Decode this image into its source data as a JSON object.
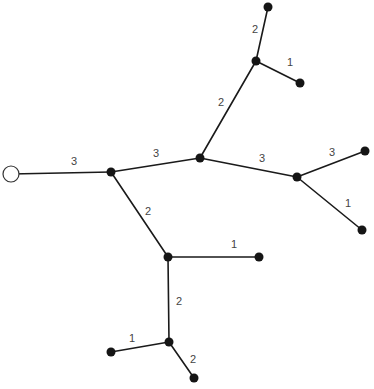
{
  "diagram": {
    "type": "weighted-tree",
    "root": "n0",
    "nodes": [
      {
        "id": "n0",
        "x": 11,
        "y": 174,
        "r": 8,
        "style": "open"
      },
      {
        "id": "n1",
        "x": 111,
        "y": 172,
        "r": 4.5,
        "style": "filled"
      },
      {
        "id": "n2",
        "x": 200,
        "y": 158,
        "r": 4.5,
        "style": "filled"
      },
      {
        "id": "n3",
        "x": 256,
        "y": 61,
        "r": 4.5,
        "style": "filled"
      },
      {
        "id": "n4",
        "x": 268,
        "y": 7,
        "r": 4.5,
        "style": "filled"
      },
      {
        "id": "n5",
        "x": 300,
        "y": 83,
        "r": 4.5,
        "style": "filled"
      },
      {
        "id": "n6",
        "x": 297,
        "y": 177,
        "r": 4.5,
        "style": "filled"
      },
      {
        "id": "n7",
        "x": 365,
        "y": 151,
        "r": 4.5,
        "style": "filled"
      },
      {
        "id": "n8",
        "x": 362,
        "y": 230,
        "r": 4.5,
        "style": "filled"
      },
      {
        "id": "n9",
        "x": 168,
        "y": 257,
        "r": 4.5,
        "style": "filled"
      },
      {
        "id": "n10",
        "x": 259,
        "y": 257,
        "r": 4.5,
        "style": "filled"
      },
      {
        "id": "n11",
        "x": 169,
        "y": 342,
        "r": 4.5,
        "style": "filled"
      },
      {
        "id": "n12",
        "x": 111,
        "y": 352,
        "r": 4.5,
        "style": "filled"
      },
      {
        "id": "n13",
        "x": 194,
        "y": 378,
        "r": 4.5,
        "style": "filled"
      }
    ],
    "edges": [
      {
        "from": "n0",
        "to": "n1",
        "label": "3",
        "lx": 74,
        "ly": 162
      },
      {
        "from": "n1",
        "to": "n2",
        "label": "3",
        "lx": 156,
        "ly": 154
      },
      {
        "from": "n2",
        "to": "n3",
        "label": "2",
        "lx": 221,
        "ly": 103
      },
      {
        "from": "n3",
        "to": "n4",
        "label": "2",
        "lx": 255,
        "ly": 30
      },
      {
        "from": "n3",
        "to": "n5",
        "label": "1",
        "lx": 290,
        "ly": 63
      },
      {
        "from": "n2",
        "to": "n6",
        "label": "3",
        "lx": 262,
        "ly": 159
      },
      {
        "from": "n6",
        "to": "n7",
        "label": "3",
        "lx": 332,
        "ly": 153
      },
      {
        "from": "n6",
        "to": "n8",
        "label": "1",
        "lx": 348,
        "ly": 204
      },
      {
        "from": "n1",
        "to": "n9",
        "label": "2",
        "lx": 148,
        "ly": 212
      },
      {
        "from": "n9",
        "to": "n10",
        "label": "1",
        "lx": 234,
        "ly": 245
      },
      {
        "from": "n9",
        "to": "n11",
        "label": "2",
        "lx": 179,
        "ly": 302
      },
      {
        "from": "n11",
        "to": "n12",
        "label": "1",
        "lx": 132,
        "ly": 339
      },
      {
        "from": "n11",
        "to": "n13",
        "label": "2",
        "lx": 193,
        "ly": 360
      }
    ],
    "edge_labels": [
      "3",
      "3",
      "2",
      "2",
      "1",
      "3",
      "3",
      "1",
      "2",
      "1",
      "2",
      "1",
      "2"
    ]
  }
}
